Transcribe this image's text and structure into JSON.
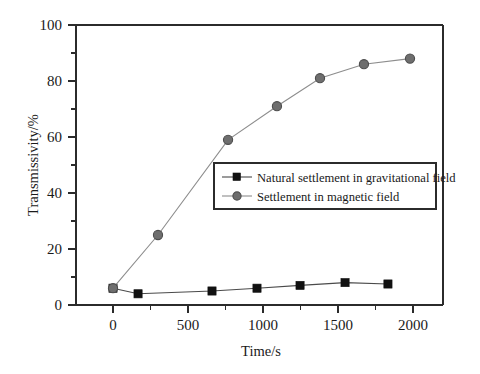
{
  "chart_data": {
    "type": "line",
    "title": "",
    "xlabel": "Time/s",
    "ylabel": "Transmissivity/%",
    "xlim": [
      -170,
      2160
    ],
    "ylim": [
      0,
      100
    ],
    "xticks": [
      0,
      500,
      1000,
      1500,
      2000
    ],
    "xticklabels": [
      "0",
      "500",
      "1000",
      "1500",
      "2000"
    ],
    "yticks": [
      0,
      20,
      40,
      60,
      80,
      100
    ],
    "yticklabels": [
      "0",
      "20",
      "40",
      "60",
      "80",
      "100"
    ],
    "x_minor_ticks": [
      250,
      750,
      1250,
      1750
    ],
    "y_minor_ticks": [
      10,
      30,
      50,
      70,
      90
    ],
    "grid": false,
    "legend_position": "center-right",
    "series": [
      {
        "name": "Natural settlement in gravitational field",
        "marker": "square",
        "color": "#111111",
        "line_color": "#4a4a4a",
        "x": [
          0,
          167,
          660,
          960,
          1247,
          1547,
          1833
        ],
        "y": [
          6,
          4,
          5,
          6,
          7,
          8,
          7.5
        ]
      },
      {
        "name": "Settlement in magnetic field",
        "marker": "circle",
        "color": "#6e6e6e",
        "line_color": "#8d8d8d",
        "x": [
          0,
          300,
          767,
          1093,
          1380,
          1673,
          1980
        ],
        "y": [
          6,
          25,
          59,
          71,
          81,
          86,
          88
        ]
      }
    ]
  },
  "legend": {
    "entries": [
      {
        "label": "Natural settlement in gravitational field"
      },
      {
        "label": "Settlement in magnetic field"
      }
    ]
  },
  "axes": {
    "x_title": "Time/s",
    "y_title": "Transmissivity/%"
  }
}
